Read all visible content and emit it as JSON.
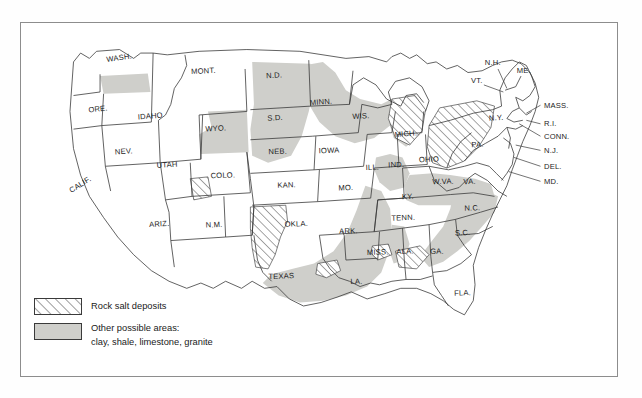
{
  "map": {
    "title": "United States rock salt deposits and other possible areas",
    "colors": {
      "shaded_area": "#cfcfcb",
      "outline": "#3a3a3a",
      "frame": "#8d8d8d",
      "background": "#ffffff",
      "label_text": "#1c1c1c"
    },
    "states": [
      {
        "abbr": "WASH.",
        "x": 96,
        "y": 42,
        "rot": -8
      },
      {
        "abbr": "ORE.",
        "x": 72,
        "y": 100,
        "rot": -6
      },
      {
        "abbr": "CALIF.",
        "x": 53,
        "y": 185,
        "rot": -32
      },
      {
        "abbr": "IDAHO",
        "x": 131,
        "y": 108,
        "rot": -4
      },
      {
        "abbr": "MONT.",
        "x": 191,
        "y": 57,
        "rot": -3
      },
      {
        "abbr": "WYO.",
        "x": 205,
        "y": 122,
        "rot": -3
      },
      {
        "abbr": "NEV.",
        "x": 101,
        "y": 148,
        "rot": -4
      },
      {
        "abbr": "UTAH",
        "x": 150,
        "y": 163,
        "rot": -3
      },
      {
        "abbr": "COLO.",
        "x": 213,
        "y": 175,
        "rot": -2
      },
      {
        "abbr": "ARIZ.",
        "x": 141,
        "y": 230,
        "rot": -3
      },
      {
        "abbr": "N.M.",
        "x": 203,
        "y": 231,
        "rot": -2
      },
      {
        "abbr": "N.D.",
        "x": 271,
        "y": 62,
        "rot": -3
      },
      {
        "abbr": "S.D.",
        "x": 272,
        "y": 110,
        "rot": -3
      },
      {
        "abbr": "NEB.",
        "x": 275,
        "y": 148,
        "rot": -2
      },
      {
        "abbr": "KAN.",
        "x": 285,
        "y": 186,
        "rot": -2
      },
      {
        "abbr": "OKLA.",
        "x": 296,
        "y": 230,
        "rot": -2
      },
      {
        "abbr": "TEXAS",
        "x": 279,
        "y": 289,
        "rot": -2
      },
      {
        "abbr": "MINN.",
        "x": 324,
        "y": 92,
        "rot": -4
      },
      {
        "abbr": "IOWA",
        "x": 333,
        "y": 147,
        "rot": -2
      },
      {
        "abbr": "MO.",
        "x": 352,
        "y": 189,
        "rot": -2
      },
      {
        "abbr": "ARK.",
        "x": 355,
        "y": 238,
        "rot": -2
      },
      {
        "abbr": "LA.",
        "x": 364,
        "y": 295,
        "rot": -2
      },
      {
        "abbr": "WIS.",
        "x": 369,
        "y": 108,
        "rot": -3
      },
      {
        "abbr": "ILL.",
        "x": 382,
        "y": 166,
        "rot": -2
      },
      {
        "abbr": "IND.",
        "x": 409,
        "y": 163,
        "rot": -2
      },
      {
        "abbr": "MICH.",
        "x": 420,
        "y": 128,
        "rot": -5
      },
      {
        "abbr": "MISS.",
        "x": 388,
        "y": 262,
        "rot": -2
      },
      {
        "abbr": "ALA.",
        "x": 419,
        "y": 261,
        "rot": -2
      },
      {
        "abbr": "TENN.",
        "x": 417,
        "y": 223,
        "rot": -2
      },
      {
        "abbr": "KY.",
        "x": 422,
        "y": 199,
        "rot": -2
      },
      {
        "abbr": "OHIO",
        "x": 446,
        "y": 157,
        "rot": -2
      },
      {
        "abbr": "W.VA.",
        "x": 462,
        "y": 182,
        "rot": -2
      },
      {
        "abbr": "VA.",
        "x": 492,
        "y": 182,
        "rot": -2
      },
      {
        "abbr": "GA.",
        "x": 455,
        "y": 261,
        "rot": -2
      },
      {
        "abbr": "S.C.",
        "x": 484,
        "y": 240,
        "rot": -2
      },
      {
        "abbr": "N.C.",
        "x": 495,
        "y": 212,
        "rot": -2
      },
      {
        "abbr": "FLA.",
        "x": 484,
        "y": 308,
        "rot": -2
      },
      {
        "abbr": "PA.",
        "x": 501,
        "y": 140,
        "rot": -3
      },
      {
        "abbr": "N.Y.",
        "x": 522,
        "y": 110,
        "rot": -3
      }
    ],
    "callout_labels": [
      {
        "abbr": "N.H.",
        "x": 518,
        "y": 48,
        "anchor": "middle",
        "lx1": 527,
        "ly1": 52,
        "lx2": 539,
        "ly2": 72
      },
      {
        "abbr": "ME.",
        "x": 553,
        "y": 56,
        "anchor": "middle",
        "lx1": 0,
        "ly1": 0,
        "lx2": 0,
        "ly2": 0
      },
      {
        "abbr": "VT.",
        "x": 500,
        "y": 68,
        "anchor": "middle",
        "lx1": 509,
        "ly1": 70,
        "lx2": 532,
        "ly2": 76
      },
      {
        "abbr": "MASS.",
        "x": 576,
        "y": 96,
        "anchor": "start",
        "lx1": 574,
        "ly1": 93,
        "lx2": 556,
        "ly2": 104
      },
      {
        "abbr": "R.I.",
        "x": 576,
        "y": 117,
        "anchor": "start",
        "lx1": 574,
        "ly1": 114,
        "lx2": 557,
        "ly2": 110
      },
      {
        "abbr": "CONN.",
        "x": 576,
        "y": 131,
        "anchor": "start",
        "lx1": 574,
        "ly1": 128,
        "lx2": 549,
        "ly2": 113
      },
      {
        "abbr": "N.J.",
        "x": 576,
        "y": 147,
        "anchor": "start",
        "lx1": 574,
        "ly1": 144,
        "lx2": 545,
        "ly2": 138
      },
      {
        "abbr": "DEL.",
        "x": 576,
        "y": 165,
        "anchor": "start",
        "lx1": 574,
        "ly1": 162,
        "lx2": 543,
        "ly2": 155
      },
      {
        "abbr": "MD.",
        "x": 576,
        "y": 182,
        "anchor": "start",
        "lx1": 574,
        "ly1": 179,
        "lx2": 537,
        "ly2": 168
      }
    ]
  },
  "legend": {
    "items": [
      {
        "id": "rock-salt",
        "pattern": "hatch",
        "label": "Rock salt deposits",
        "label2": ""
      },
      {
        "id": "other-areas",
        "pattern": "solid-gray",
        "label": "Other possible areas:",
        "label2": "clay, shale, limestone, granite"
      }
    ]
  }
}
